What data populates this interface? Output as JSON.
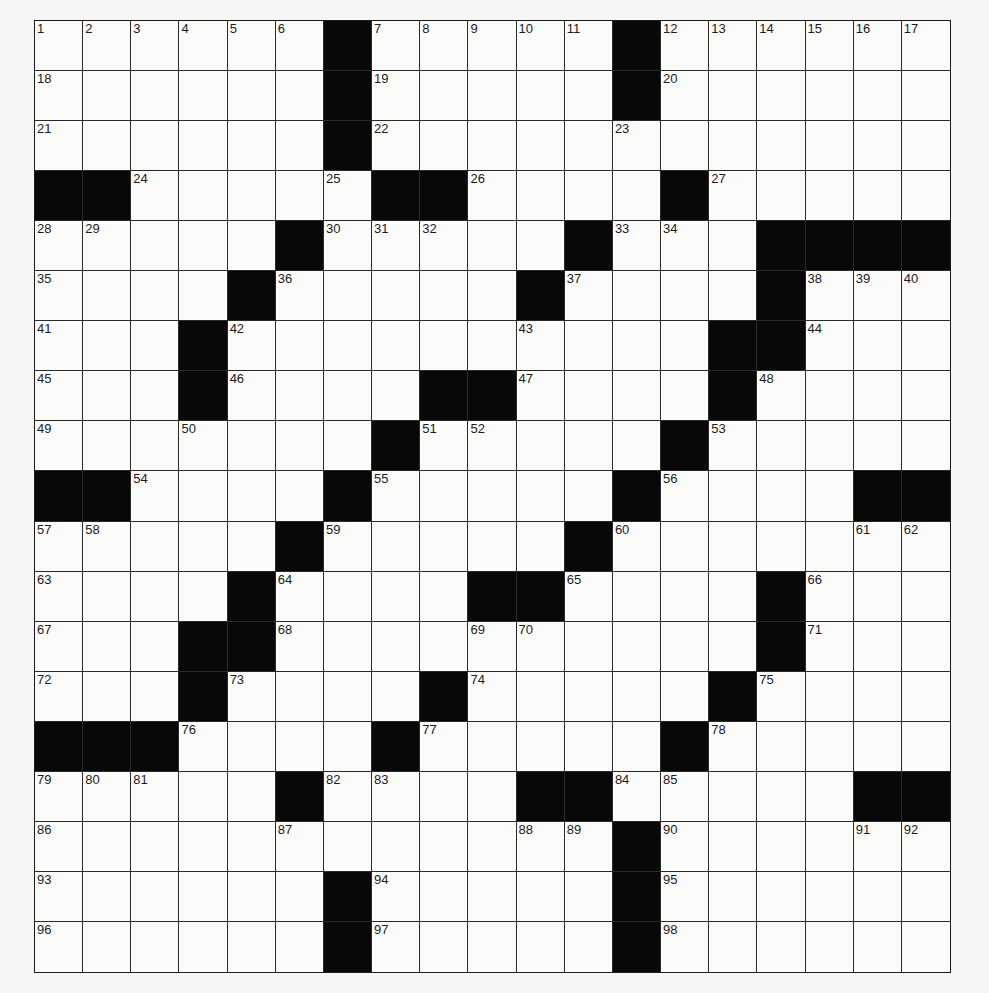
{
  "puzzle": {
    "size": {
      "rows": 19,
      "cols": 19
    },
    "colors": {
      "block": "#080808",
      "cell": "#fbfbfa",
      "line": "#2a2a2a",
      "paper": "#f6f6f4"
    },
    "grid": [
      "......#.....#......",
      "......#.....#......",
      "......#............",
      "##.....##....#.....",
      ".....#.....#...####",
      "....#.....#....#...",
      "...#..........##...",
      "...#....##....#....",
      ".......#.....#.....",
      "##....#.....#....##",
      ".....#.....#.......",
      "....#....##....#...",
      "...##..........#...",
      "...#....#.....#....",
      "###....#.....#.....",
      ".....#....##.....##",
      "............#......",
      "......#.....#......",
      "......#.....#......"
    ],
    "numbers": {
      "0": {
        "0": "1",
        "1": "2",
        "2": "3",
        "3": "4",
        "4": "5",
        "5": "6",
        "7": "7",
        "8": "8",
        "9": "9",
        "10": "10",
        "11": "11",
        "13": "12",
        "14": "13",
        "15": "14",
        "16": "15",
        "17": "16",
        "18": "17"
      },
      "1": {
        "0": "18",
        "7": "19",
        "13": "20"
      },
      "2": {
        "0": "21",
        "7": "22",
        "12": "23"
      },
      "3": {
        "2": "24",
        "6": "25",
        "9": "26",
        "14": "27"
      },
      "4": {
        "0": "28",
        "1": "29",
        "6": "30",
        "7": "31",
        "8": "32",
        "12": "33",
        "13": "34"
      },
      "5": {
        "0": "35",
        "5": "36",
        "11": "37",
        "16": "38",
        "17": "39",
        "18": "40"
      },
      "6": {
        "0": "41",
        "4": "42",
        "10": "43",
        "16": "44"
      },
      "7": {
        "0": "45",
        "4": "46",
        "10": "47",
        "15": "48"
      },
      "8": {
        "0": "49",
        "3": "50",
        "8": "51",
        "9": "52",
        "14": "53"
      },
      "9": {
        "2": "54",
        "7": "55",
        "13": "56"
      },
      "10": {
        "0": "57",
        "1": "58",
        "6": "59",
        "12": "60",
        "17": "61",
        "18": "62"
      },
      "11": {
        "0": "63",
        "5": "64",
        "11": "65",
        "16": "66"
      },
      "12": {
        "0": "67",
        "5": "68",
        "9": "69",
        "10": "70",
        "16": "71"
      },
      "13": {
        "0": "72",
        "4": "73",
        "9": "74",
        "15": "75"
      },
      "14": {
        "3": "76",
        "8": "77",
        "14": "78"
      },
      "15": {
        "0": "79",
        "1": "80",
        "2": "81",
        "6": "82",
        "7": "83",
        "12": "84",
        "13": "85"
      },
      "16": {
        "0": "86",
        "5": "87",
        "10": "88",
        "11": "89",
        "13": "90",
        "17": "91",
        "18": "92"
      },
      "17": {
        "0": "93",
        "7": "94",
        "13": "95"
      },
      "18": {
        "0": "96",
        "7": "97",
        "13": "98"
      }
    },
    "letters": {}
  }
}
